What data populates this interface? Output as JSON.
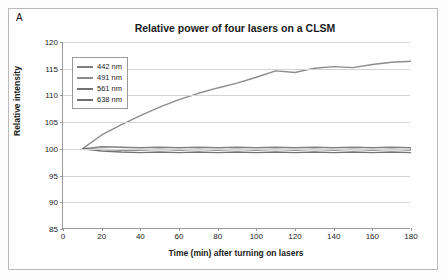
{
  "panel": {
    "label": "A"
  },
  "chart_data": {
    "type": "line",
    "title": "Relative power of four lasers on a CLSM",
    "xlabel": "Time (min) after turning on lasers",
    "ylabel": "Relative intensity",
    "xlim": [
      0,
      180
    ],
    "ylim": [
      85,
      120
    ],
    "xticks": [
      0,
      20,
      40,
      60,
      80,
      100,
      120,
      140,
      160,
      180
    ],
    "yticks": [
      85,
      90,
      95,
      100,
      105,
      110,
      115,
      120
    ],
    "grid": "horizontal",
    "legend_position": "top-left-inside",
    "x": [
      10,
      20,
      30,
      40,
      50,
      60,
      70,
      80,
      90,
      100,
      110,
      120,
      130,
      140,
      150,
      160,
      170,
      180
    ],
    "series": [
      {
        "name": "442 nm",
        "color": "#808080",
        "values": [
          100.0,
          100.4,
          100.3,
          100.2,
          100.3,
          100.2,
          100.3,
          100.2,
          100.3,
          100.2,
          100.3,
          100.2,
          100.3,
          100.2,
          100.3,
          100.2,
          100.3,
          100.2
        ]
      },
      {
        "name": "491 nm",
        "color": "#8c8c8c",
        "values": [
          100.0,
          102.6,
          104.5,
          106.2,
          107.8,
          109.2,
          110.4,
          111.4,
          112.3,
          113.4,
          114.6,
          114.3,
          115.1,
          115.4,
          115.2,
          115.8,
          116.2,
          116.4
        ]
      },
      {
        "name": "561 nm",
        "color": "#737373",
        "values": [
          100.0,
          99.6,
          99.4,
          99.3,
          99.4,
          99.3,
          99.4,
          99.3,
          99.4,
          99.3,
          99.4,
          99.3,
          99.4,
          99.3,
          99.4,
          99.3,
          99.4,
          99.3
        ]
      },
      {
        "name": "638 nm",
        "color": "#6e6e6e",
        "values": [
          100.0,
          99.9,
          99.8,
          99.8,
          99.9,
          99.8,
          99.9,
          99.8,
          99.9,
          99.8,
          99.9,
          99.8,
          99.9,
          99.8,
          99.9,
          99.8,
          99.9,
          99.8
        ]
      }
    ]
  }
}
